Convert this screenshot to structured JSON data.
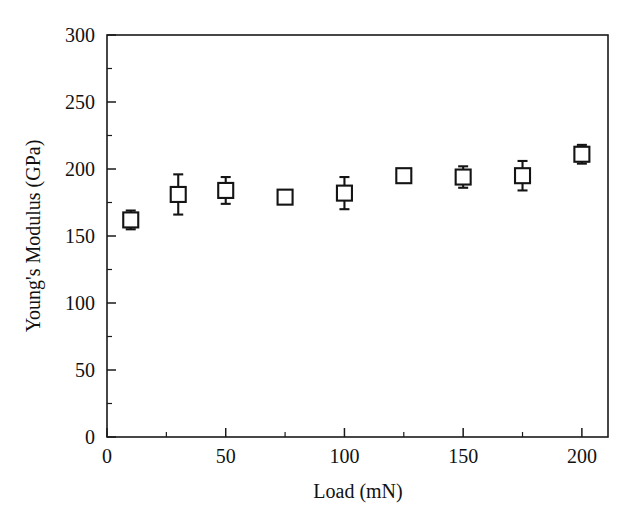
{
  "chart_data": {
    "type": "scatter",
    "title": "",
    "xlabel": "Load (mN)",
    "ylabel": "Young's Modulus (GPa)",
    "xlim": [
      0,
      211
    ],
    "ylim": [
      0,
      300
    ],
    "xticks": [
      0,
      50,
      100,
      150,
      200
    ],
    "xtick_labels": [
      "0",
      "50",
      "100",
      "150",
      "200"
    ],
    "xminor_step": 25,
    "yticks": [
      0,
      50,
      100,
      150,
      200,
      250,
      300
    ],
    "ytick_labels": [
      "0",
      "50",
      "100",
      "150",
      "200",
      "250",
      "300"
    ],
    "yminor_step": 25,
    "grid": false,
    "legend": null,
    "marker": "open-square-with-error-bars",
    "marker_color": "#141414",
    "marker_fill": "#ffffff",
    "frame_color": "#1a1a1a",
    "background": "#ffffff",
    "x": [
      10,
      30,
      50,
      75,
      100,
      125,
      150,
      175,
      200
    ],
    "values": [
      162,
      181,
      184,
      179,
      182,
      195,
      194,
      195,
      211
    ],
    "yerr": [
      7,
      15,
      10,
      4,
      12,
      3,
      8,
      11,
      7
    ],
    "points": [
      {
        "load": 10,
        "modulus": 162,
        "err": 7
      },
      {
        "load": 30,
        "modulus": 181,
        "err": 15
      },
      {
        "load": 50,
        "modulus": 184,
        "err": 10
      },
      {
        "load": 75,
        "modulus": 179,
        "err": 4
      },
      {
        "load": 100,
        "modulus": 182,
        "err": 12
      },
      {
        "load": 125,
        "modulus": 195,
        "err": 3
      },
      {
        "load": 150,
        "modulus": 194,
        "err": 8
      },
      {
        "load": 175,
        "modulus": 195,
        "err": 11
      },
      {
        "load": 200,
        "modulus": 211,
        "err": 7
      }
    ]
  },
  "axes": {
    "x_title": "Load (mN)",
    "y_title": "Young's Modulus (GPa)"
  }
}
